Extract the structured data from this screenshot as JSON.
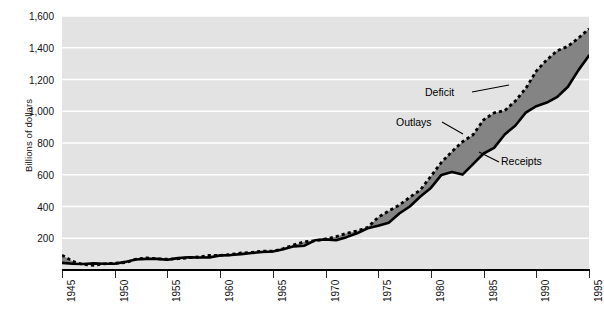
{
  "chart_data": {
    "type": "area",
    "title": "",
    "xlabel": "",
    "ylabel": "Billions of dollars",
    "xlim": [
      1945,
      1995
    ],
    "ylim": [
      0,
      1600
    ],
    "grid": true,
    "legend_position": "inline-annotations",
    "xticks": [
      "1945",
      "1950",
      "1955",
      "1960",
      "1965",
      "1970",
      "1975",
      "1980",
      "1985",
      "1990",
      "1995"
    ],
    "yticks": [
      "200",
      "400",
      "600",
      "800",
      "1,000",
      "1,200",
      "1,400",
      "1,600"
    ],
    "annotations": [
      {
        "label": "Deficit",
        "note": "shaded area between Outlays and Receipts"
      },
      {
        "label": "Outlays",
        "note": "dotted black line (upper)"
      },
      {
        "label": "Receipts",
        "note": "solid black line (lower)"
      }
    ],
    "x": [
      1945,
      1946,
      1947,
      1948,
      1949,
      1950,
      1951,
      1952,
      1953,
      1954,
      1955,
      1956,
      1957,
      1958,
      1959,
      1960,
      1961,
      1962,
      1963,
      1964,
      1965,
      1966,
      1967,
      1968,
      1969,
      1970,
      1971,
      1972,
      1973,
      1974,
      1975,
      1976,
      1977,
      1978,
      1979,
      1980,
      1981,
      1982,
      1983,
      1984,
      1985,
      1986,
      1987,
      1988,
      1989,
      1990,
      1991,
      1992,
      1993,
      1994,
      1995
    ],
    "series": [
      {
        "name": "Outlays",
        "style": "dotted",
        "color": "#000000",
        "values": [
          93,
          55,
          34,
          30,
          39,
          43,
          46,
          68,
          76,
          71,
          68,
          71,
          77,
          82,
          92,
          92,
          98,
          107,
          111,
          119,
          118,
          135,
          158,
          178,
          184,
          196,
          210,
          231,
          246,
          269,
          332,
          372,
          409,
          459,
          504,
          591,
          678,
          746,
          808,
          852,
          946,
          990,
          1004,
          1064,
          1144,
          1253,
          1324,
          1382,
          1409,
          1461,
          1519
        ]
      },
      {
        "name": "Receipts",
        "style": "solid",
        "color": "#000000",
        "values": [
          45,
          39,
          38,
          42,
          39,
          39,
          51,
          66,
          70,
          70,
          65,
          75,
          80,
          79,
          79,
          92,
          94,
          100,
          107,
          113,
          117,
          131,
          149,
          153,
          187,
          193,
          187,
          207,
          231,
          263,
          279,
          298,
          356,
          400,
          463,
          517,
          599,
          618,
          601,
          667,
          734,
          769,
          854,
          909,
          991,
          1032,
          1055,
          1091,
          1154,
          1259,
          1351
        ]
      }
    ],
    "fill_between": {
      "name": "Deficit",
      "color": "#848484"
    },
    "background_color": "#e3e3e3",
    "gridline_color": "#ffffff"
  },
  "axis": {
    "y_title": "Billions of dollars",
    "y_labels": [
      "1,600",
      "1,400",
      "1,200",
      "1,000",
      "800",
      "600",
      "400",
      "200"
    ],
    "x_labels": [
      "1945",
      "1950",
      "1955",
      "1960",
      "1965",
      "1970",
      "1975",
      "1980",
      "1985",
      "1990",
      "1995"
    ]
  },
  "labels": {
    "deficit": "Deficit",
    "outlays": "Outlays",
    "receipts": "Receipts"
  },
  "footer": {
    "text": ""
  }
}
